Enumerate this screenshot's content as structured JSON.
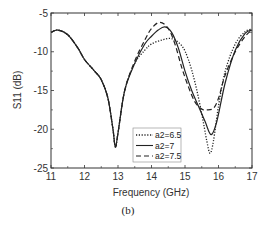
{
  "chart_data": {
    "type": "line",
    "title": "",
    "caption": "(b)",
    "xlabel": "Frequency (GHz)",
    "ylabel": "S11 (dB)",
    "xlim": [
      11,
      17
    ],
    "ylim": [
      -25,
      -5
    ],
    "xticks": [
      11,
      12,
      13,
      14,
      15,
      16,
      17
    ],
    "yticks": [
      -5,
      -10,
      -15,
      -20,
      -25
    ],
    "grid": false,
    "legend_position": "lower center-right (inside)",
    "series": [
      {
        "name": "a2=6.5",
        "style": "dotted",
        "x": [
          11.0,
          11.2,
          11.5,
          11.8,
          12.0,
          12.3,
          12.5,
          12.7,
          12.85,
          12.92,
          13.0,
          13.2,
          13.5,
          13.8,
          14.0,
          14.3,
          14.6,
          14.9,
          15.1,
          15.3,
          15.5,
          15.65,
          15.75,
          15.85,
          16.0,
          16.2,
          16.5,
          16.8,
          17.0
        ],
        "values": [
          -7.5,
          -7.2,
          -7.8,
          -9.5,
          -11.0,
          -12.5,
          -13.6,
          -16.0,
          -20.0,
          -22.3,
          -20.5,
          -15.0,
          -11.5,
          -9.8,
          -9.0,
          -8.5,
          -8.3,
          -9.2,
          -11.0,
          -14.0,
          -18.0,
          -21.5,
          -23.1,
          -21.5,
          -17.0,
          -12.5,
          -9.0,
          -7.4,
          -7.1
        ]
      },
      {
        "name": "a2=7",
        "style": "solid",
        "x": [
          11.0,
          11.2,
          11.5,
          11.8,
          12.0,
          12.3,
          12.5,
          12.7,
          12.85,
          12.92,
          13.0,
          13.2,
          13.5,
          13.8,
          14.0,
          14.2,
          14.4,
          14.6,
          14.8,
          15.0,
          15.2,
          15.4,
          15.6,
          15.78,
          15.95,
          16.2,
          16.5,
          16.8,
          17.0
        ],
        "values": [
          -7.5,
          -7.2,
          -7.8,
          -9.5,
          -11.0,
          -12.5,
          -13.6,
          -16.0,
          -20.0,
          -22.3,
          -20.5,
          -15.0,
          -11.5,
          -9.0,
          -8.0,
          -7.2,
          -6.8,
          -7.5,
          -9.5,
          -12.5,
          -15.0,
          -17.0,
          -19.0,
          -20.7,
          -19.0,
          -14.0,
          -9.8,
          -7.6,
          -7.2
        ]
      },
      {
        "name": "a2=7.5",
        "style": "dashed",
        "x": [
          11.0,
          11.2,
          11.5,
          11.8,
          12.0,
          12.3,
          12.5,
          12.7,
          12.85,
          12.92,
          13.0,
          13.2,
          13.5,
          13.8,
          14.0,
          14.25,
          14.5,
          14.7,
          14.9,
          15.1,
          15.3,
          15.5,
          15.65,
          15.85,
          16.0,
          16.2,
          16.5,
          16.8,
          17.0
        ],
        "values": [
          -7.5,
          -7.2,
          -7.8,
          -9.5,
          -11.0,
          -12.5,
          -13.6,
          -16.0,
          -20.0,
          -22.3,
          -20.5,
          -15.0,
          -11.2,
          -8.5,
          -7.0,
          -6.2,
          -7.0,
          -9.0,
          -12.0,
          -14.5,
          -16.5,
          -17.4,
          -17.5,
          -17.3,
          -16.0,
          -13.0,
          -10.0,
          -8.0,
          -7.2
        ]
      }
    ]
  },
  "legend": {
    "items": [
      {
        "label": "a2=6.5",
        "style": "dotted"
      },
      {
        "label": "a2=7",
        "style": "solid"
      },
      {
        "label": "a2=7.5",
        "style": "dashed"
      }
    ]
  },
  "colors": {
    "line": "#222222",
    "axis": "#333333",
    "background": "#ffffff"
  }
}
